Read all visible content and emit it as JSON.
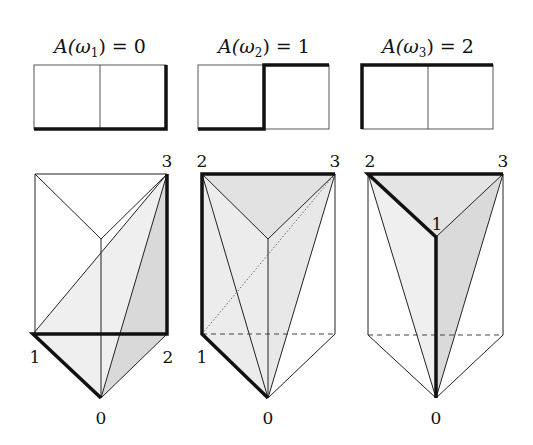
{
  "panels": [
    {
      "title": "A(ω1) = 0",
      "title_parts": {
        "fn": "A(",
        "var": "ω",
        "sub": "1",
        "rest": ") = 0"
      },
      "vertex_labels": {
        "top_right": "3",
        "bottom_left": "1",
        "bottom_right": "2",
        "bottom": "0"
      }
    },
    {
      "title": "A(ω2) = 1",
      "title_parts": {
        "fn": "A(",
        "var": "ω",
        "sub": "2",
        "rest": ") = 1"
      },
      "vertex_labels": {
        "top_left": "2",
        "top_right": "3",
        "bottom_left": "1",
        "bottom": "0"
      }
    },
    {
      "title": "A(ω3) = 2",
      "title_parts": {
        "fn": "A(",
        "var": "ω",
        "sub": "3",
        "rest": ") = 2"
      },
      "vertex_labels": {
        "top_left": "2",
        "top_right": "3",
        "middle": "1",
        "bottom": "0"
      }
    }
  ],
  "colors": {
    "line": "#1a1a1a",
    "shade_light": "#ececec",
    "shade_dark": "#d6d6d6",
    "thin": "#444444"
  }
}
